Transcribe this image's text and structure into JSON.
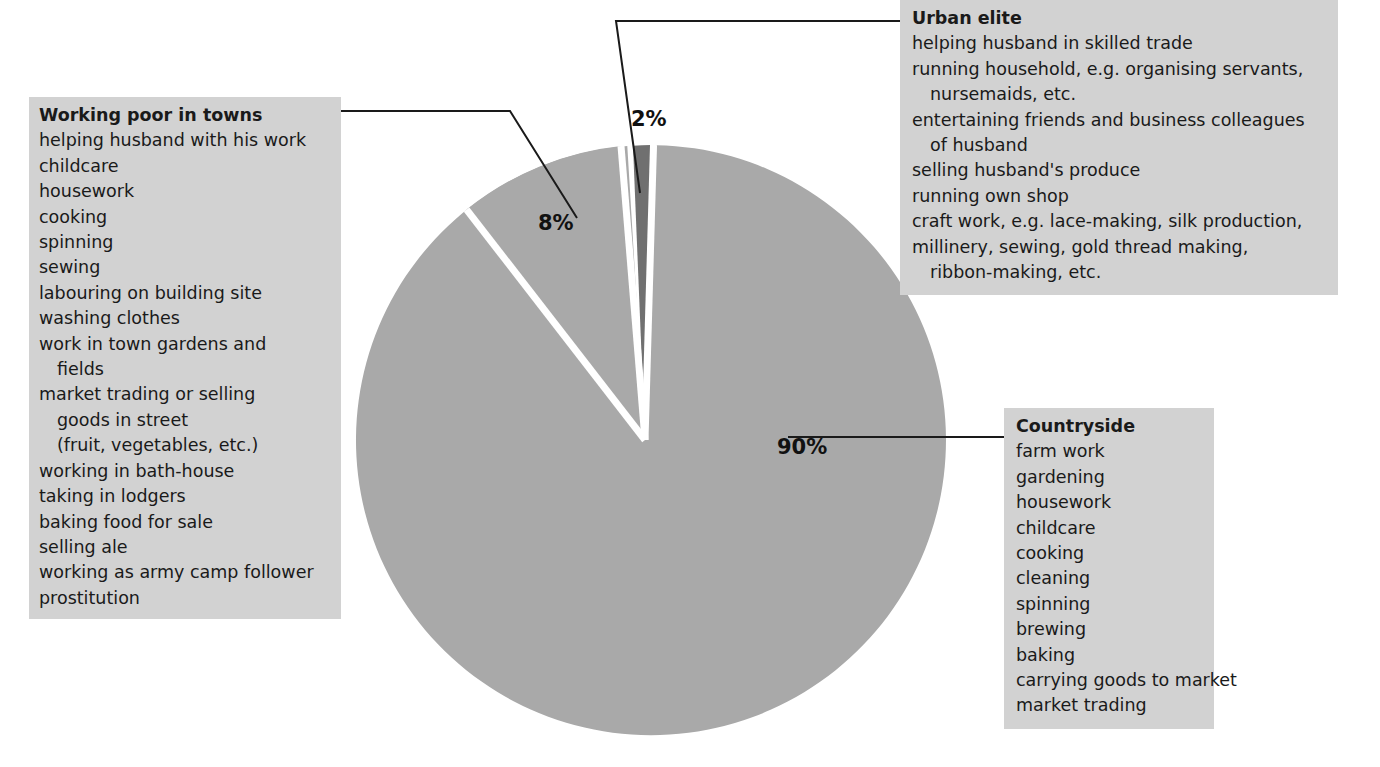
{
  "chart_data": {
    "type": "pie",
    "title": "",
    "categories": [
      "Countryside",
      "Working poor in towns",
      "Urban elite"
    ],
    "values": [
      90,
      8,
      2
    ],
    "value_labels": [
      "90%",
      "8%",
      "2%"
    ],
    "legend_position": "callout-boxes",
    "colors": {
      "slice_main": "#a9a9a9",
      "slice_dark": "#707070",
      "slice_divider": "#ffffff",
      "box_background": "#d2d2d2",
      "text": "#1a1a1a",
      "leader_line": "#1a1a1a",
      "page_background": "#ffffff"
    }
  },
  "percent_labels": {
    "urban_elite": "2%",
    "working_poor": "8%",
    "countryside": "90%"
  },
  "boxes": {
    "working_poor": {
      "title": "Working poor in towns",
      "items": [
        {
          "text": "helping husband with his work",
          "indent": false
        },
        {
          "text": "childcare",
          "indent": false
        },
        {
          "text": "housework",
          "indent": false
        },
        {
          "text": "cooking",
          "indent": false
        },
        {
          "text": "spinning",
          "indent": false
        },
        {
          "text": "sewing",
          "indent": false
        },
        {
          "text": "labouring on building site",
          "indent": false
        },
        {
          "text": "washing clothes",
          "indent": false
        },
        {
          "text": "work in town gardens and",
          "indent": false
        },
        {
          "text": "fields",
          "indent": true
        },
        {
          "text": "market trading or selling",
          "indent": false
        },
        {
          "text": "goods in street",
          "indent": true
        },
        {
          "text": "(fruit, vegetables, etc.)",
          "indent": true
        },
        {
          "text": "working in bath-house",
          "indent": false
        },
        {
          "text": "taking in lodgers",
          "indent": false
        },
        {
          "text": "baking food for sale",
          "indent": false
        },
        {
          "text": "selling ale",
          "indent": false
        },
        {
          "text": "working as army camp follower",
          "indent": false
        },
        {
          "text": "prostitution",
          "indent": false
        }
      ]
    },
    "urban_elite": {
      "title": "Urban elite",
      "items": [
        {
          "text": "helping husband in skilled trade",
          "indent": false
        },
        {
          "text": "running household, e.g. organising servants,",
          "indent": false
        },
        {
          "text": "nursemaids, etc.",
          "indent": true
        },
        {
          "text": "entertaining friends and business colleagues",
          "indent": false
        },
        {
          "text": "of husband",
          "indent": true
        },
        {
          "text": "selling husband's produce",
          "indent": false
        },
        {
          "text": "running own shop",
          "indent": false
        },
        {
          "text": "craft work, e.g. lace-making, silk production,",
          "indent": false
        },
        {
          "text": "millinery, sewing, gold thread making,",
          "indent": false
        },
        {
          "text": "ribbon-making, etc.",
          "indent": true
        }
      ]
    },
    "countryside": {
      "title": "Countryside",
      "items": [
        {
          "text": "farm work",
          "indent": false
        },
        {
          "text": "gardening",
          "indent": false
        },
        {
          "text": "housework",
          "indent": false
        },
        {
          "text": "childcare",
          "indent": false
        },
        {
          "text": "cooking",
          "indent": false
        },
        {
          "text": "cleaning",
          "indent": false
        },
        {
          "text": "spinning",
          "indent": false
        },
        {
          "text": "brewing",
          "indent": false
        },
        {
          "text": "baking",
          "indent": false
        },
        {
          "text": "carrying goods to market",
          "indent": false
        },
        {
          "text": "market trading",
          "indent": false
        }
      ]
    }
  }
}
